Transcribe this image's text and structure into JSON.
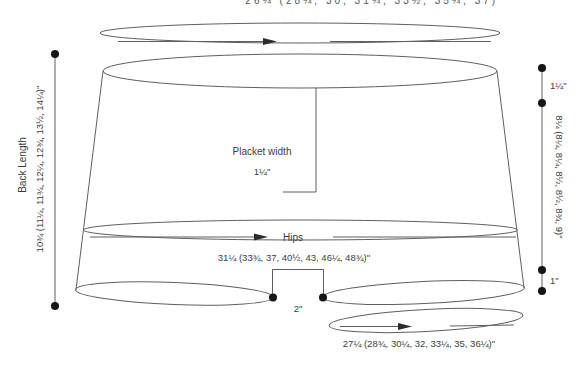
{
  "diagram": {
    "kind": "garment-measurement-schematic",
    "top_clipped_label": "26¼ (28¼, 30, 31¾, 33½, 35¼, 37)\"",
    "back_length": {
      "title": "Back Length",
      "values": "10¾ (11¼, 11¾, 12¼, 12¾, 13½, 14¼)\""
    },
    "placket": {
      "label": "Placket width",
      "value": "1¼\""
    },
    "hips": {
      "label": "Hips",
      "values": "31¼ (33¾, 37, 40½, 43, 46¼, 48¾)\""
    },
    "vent": {
      "width": "2\""
    },
    "hem": {
      "values": "27¼ (28¾, 30¼, 32, 33¼, 35, 36¼)\""
    },
    "right_side": {
      "top_segment": "1¼\"",
      "middle_segment_values": "8¼ (8¼, 8¼, 8½, 8½, 8¾, 9)\"",
      "bottom_segment": "1\""
    },
    "colors": {
      "line": "#5f5f5f",
      "text": "#3d3d3d",
      "dot": "#151515",
      "background": "#ffffff"
    }
  }
}
